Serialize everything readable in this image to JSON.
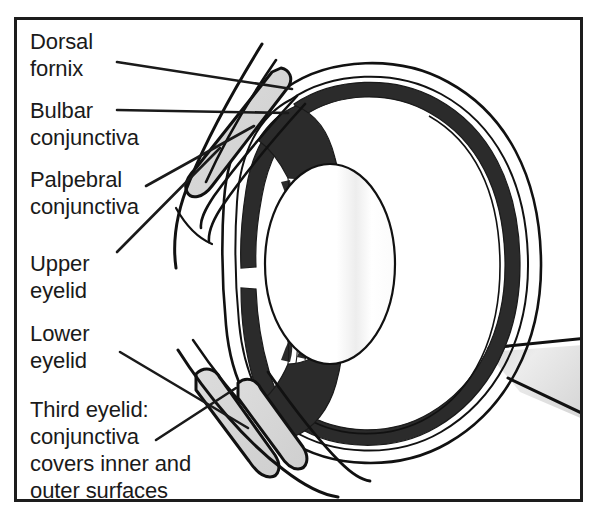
{
  "figure": {
    "border_color": "#1d1d1d",
    "background_color": "#ffffff"
  },
  "palette": {
    "ink": "#1a1a1a",
    "outline": "#111111",
    "uvea_dark": "#2b2b2b",
    "conjunctiva_gray": "#d8d8d8",
    "optic_nerve_gray": "#dcdcdc",
    "lens_white": "#ffffff",
    "globe_white": "#ffffff"
  },
  "labels": [
    {
      "name": "dorsal-fornix",
      "lines": [
        "Dorsal",
        "fornix"
      ],
      "text": "Dorsal\nfornix",
      "x": 30,
      "y": 28
    },
    {
      "name": "bulbar-conjunctiva",
      "lines": [
        "Bulbar",
        "conjunctiva"
      ],
      "text": "Bulbar\nconjunctiva",
      "x": 30,
      "y": 97
    },
    {
      "name": "palpebral-conjunctiva",
      "lines": [
        "Palpebral",
        "conjunctiva"
      ],
      "text": "Palpebral\nconjunctiva",
      "x": 30,
      "y": 166
    },
    {
      "name": "upper-eyelid",
      "lines": [
        "Upper",
        "eyelid"
      ],
      "text": "Upper\neyelid",
      "x": 30,
      "y": 250
    },
    {
      "name": "lower-eyelid",
      "lines": [
        "Lower",
        "eyelid"
      ],
      "text": "Lower\neyelid",
      "x": 30,
      "y": 320
    },
    {
      "name": "third-eyelid",
      "lines": [
        "Third eyelid:",
        "conjunctiva",
        "covers inner and",
        "outer surfaces"
      ],
      "text": "Third eyelid:\nconjunctiva\ncovers inner and\nouter surfaces",
      "x": 30,
      "y": 396
    }
  ],
  "structures": [
    {
      "name": "globe-sclera",
      "description": "Outer fibrous coat of the eyeball"
    },
    {
      "name": "uvea-choroid",
      "description": "Dark inner vascular layer"
    },
    {
      "name": "retina",
      "description": "Thin inner line of the globe wall"
    },
    {
      "name": "cornea",
      "description": "Transparent anterior dome"
    },
    {
      "name": "iris",
      "description": "Dark anterior structure with central pupil gap"
    },
    {
      "name": "ciliary-body",
      "description": "Dark triangular body at the lens equator"
    },
    {
      "name": "zonular-fibers",
      "description": "Fine suspensory fibers from ciliary body to lens"
    },
    {
      "name": "lens",
      "description": "Large oval crystalline lens"
    },
    {
      "name": "vitreous-chamber",
      "description": "Large posterior cavity"
    },
    {
      "name": "optic-nerve",
      "description": "Light-gray wedge exiting posteriorly"
    },
    {
      "name": "upper-eyelid",
      "description": "Narrow gray-filled loop above the globe"
    },
    {
      "name": "lower-eyelid",
      "description": "Gray-filled loop below the globe"
    },
    {
      "name": "third-eyelid",
      "description": "Inner gray loop beside the lower eyelid"
    },
    {
      "name": "dorsal-fornix",
      "description": "Conjunctival recess at top of eyelid"
    }
  ],
  "leaders": [
    {
      "name": "leader-dorsal-fornix",
      "from": [
        117,
        62
      ],
      "to": [
        290,
        88
      ]
    },
    {
      "name": "leader-bulbar-conjunctiva",
      "from": [
        117,
        110
      ],
      "to": [
        286,
        112
      ]
    },
    {
      "name": "leader-palpebral-conjunctiva",
      "from": [
        146,
        186
      ],
      "to": [
        252,
        127
      ]
    },
    {
      "name": "leader-upper-eyelid",
      "from": [
        117,
        252
      ],
      "to": [
        218,
        150
      ]
    },
    {
      "name": "leader-lower-eyelid",
      "from": [
        120,
        352
      ],
      "to": [
        244,
        424
      ]
    },
    {
      "name": "leader-third-eyelid",
      "from": [
        158,
        438
      ],
      "to": [
        232,
        390
      ]
    }
  ]
}
